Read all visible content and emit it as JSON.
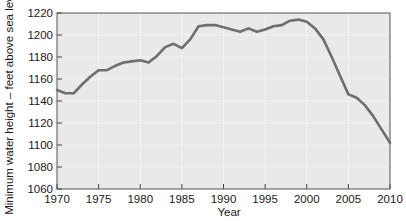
{
  "chart_data": {
    "type": "line",
    "title": "",
    "xlabel": "Year",
    "ylabel": "Minimum water height – feet above sea level",
    "xlim": [
      1970,
      2010
    ],
    "ylim": [
      1060,
      1220
    ],
    "xticks": [
      1970,
      1975,
      1980,
      1985,
      1990,
      1995,
      2000,
      2005,
      2010
    ],
    "yticks": [
      1060,
      1080,
      1100,
      1120,
      1140,
      1160,
      1180,
      1200,
      1220
    ],
    "grid": true,
    "legend": null,
    "line_color": "#6e6e6e",
    "plot_background": "#e9e9e9",
    "series": [
      {
        "name": "Minimum water height",
        "x": [
          1970,
          1971,
          1972,
          1973,
          1974,
          1975,
          1976,
          1977,
          1978,
          1979,
          1980,
          1981,
          1982,
          1983,
          1984,
          1985,
          1986,
          1987,
          1988,
          1989,
          1990,
          1991,
          1992,
          1993,
          1994,
          1995,
          1996,
          1997,
          1998,
          1999,
          2000,
          2001,
          2002,
          2003,
          2004,
          2005,
          2006,
          2007,
          2008,
          2009,
          2010
        ],
        "values": [
          1150,
          1147,
          1147,
          1155,
          1162,
          1168,
          1168,
          1172,
          1175,
          1176,
          1177,
          1175,
          1181,
          1189,
          1192,
          1188,
          1196,
          1208,
          1209,
          1209,
          1207,
          1205,
          1203,
          1206,
          1203,
          1205,
          1208,
          1209,
          1213,
          1214,
          1212,
          1206,
          1196,
          1180,
          1163,
          1146,
          1143,
          1136,
          1126,
          1114,
          1102
        ]
      }
    ]
  },
  "axis": {
    "x_tick_labels": [
      "1970",
      "1975",
      "1980",
      "1985",
      "1990",
      "1995",
      "2000",
      "2005",
      "2010"
    ],
    "y_tick_labels": [
      "1060",
      "1080",
      "1100",
      "1120",
      "1140",
      "1160",
      "1180",
      "1200",
      "1220"
    ],
    "x_title": "Year",
    "y_title": "Minimum water height – feet above sea level"
  }
}
